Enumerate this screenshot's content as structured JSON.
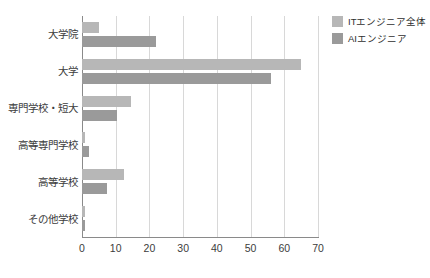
{
  "chart_data": {
    "type": "bar",
    "orientation": "horizontal",
    "title": "",
    "subtitle": "",
    "xlabel": "",
    "ylabel": "",
    "xlim": [
      0,
      70
    ],
    "xticks": [
      0,
      10,
      20,
      30,
      40,
      50,
      60,
      70
    ],
    "xtick_labels": [
      "0",
      "10",
      "20",
      "30",
      "40",
      "50",
      "60",
      "70"
    ],
    "grid": "vertical",
    "legend_position": "right-top",
    "categories": [
      "大学院",
      "大学",
      "専門学校・短大",
      "高等専門学校",
      "高等学校",
      "その他学校"
    ],
    "series": [
      {
        "name": "ITエンジニア全体",
        "color": "#b7b7b7",
        "values": [
          5,
          65,
          14.5,
          1,
          12.5,
          1
        ]
      },
      {
        "name": "AIエンジニア",
        "color": "#9a9a9a",
        "values": [
          22,
          56,
          10.5,
          2,
          7.5,
          1
        ]
      }
    ]
  },
  "legend": {
    "items": [
      {
        "label": "ITエンジニア全体",
        "series_key": "it"
      },
      {
        "label": "AIエンジニア",
        "series_key": "ai"
      }
    ]
  },
  "colors": {
    "series_it": "#b7b7b7",
    "series_ai": "#9a9a9a",
    "gridline": "#d8d8d8",
    "axis": "#8a8a8a",
    "text": "#3c3c3c",
    "background": "#ffffff"
  }
}
